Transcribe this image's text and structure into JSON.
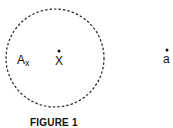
{
  "figure": {
    "caption": "FIGURE 1",
    "set_label": "A",
    "set_subscript": "x",
    "center_point_label": "X",
    "outside_point_label": "a",
    "circle": {
      "cx": 55,
      "cy": 58,
      "rx": 49,
      "ry": 49,
      "style": "dashed"
    },
    "center_point": {
      "x": 59,
      "y": 51
    },
    "outside_point": {
      "x": 167,
      "y": 50
    },
    "colors": {
      "stroke": "#222222",
      "background": "#ffffff"
    }
  }
}
